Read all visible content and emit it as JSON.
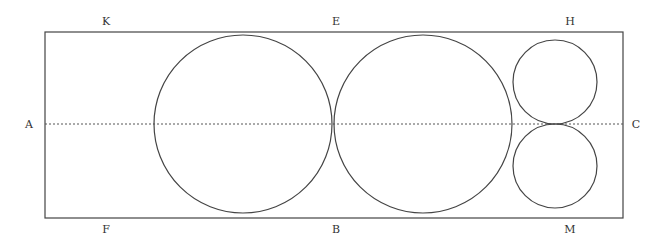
{
  "diagram": {
    "labels": {
      "K": "K",
      "E": "E",
      "H": "H",
      "A": "A",
      "C": "C",
      "F": "F",
      "B": "B",
      "M": "M"
    },
    "rectangle": {
      "x": 45,
      "y": 32,
      "width": 578,
      "height": 186
    },
    "axis_line": {
      "x1": 45,
      "x2": 623,
      "y": 124,
      "style": "dashed"
    },
    "circles": [
      {
        "name": "large-circle-left",
        "cx": 243,
        "cy": 124,
        "r": 89
      },
      {
        "name": "large-circle-right",
        "cx": 423,
        "cy": 124,
        "r": 89
      },
      {
        "name": "small-circle-top",
        "cx": 555,
        "cy": 82,
        "r": 42
      },
      {
        "name": "small-circle-bottom",
        "cx": 555,
        "cy": 166,
        "r": 42
      }
    ],
    "colors": {
      "stroke": "#444444",
      "background": "#ffffff"
    }
  }
}
